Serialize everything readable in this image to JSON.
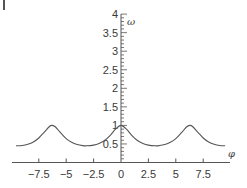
{
  "chart_data": {
    "type": "line",
    "title": "",
    "xlabel": "φ",
    "ylabel": "ω",
    "xlim": [
      -9.6,
      9.5
    ],
    "ylim": [
      0,
      4
    ],
    "grid": false,
    "legend": null,
    "x_ticks": [
      -7.5,
      -5,
      -2.5,
      0,
      2.5,
      5,
      7.5
    ],
    "x_tick_labels": [
      "−7.5",
      "−5",
      "−2.5",
      "0",
      "2.5",
      "5",
      "7.5"
    ],
    "y_ticks": [
      0.5,
      1,
      1.5,
      2,
      2.5,
      3,
      3.5,
      4
    ],
    "y_tick_labels": [
      "0.5",
      "1",
      "1.5",
      "2",
      "2.5",
      "3",
      "3.5",
      "4"
    ],
    "y_minor_tick_step": 0.1,
    "series": [
      {
        "name": "ω(φ)",
        "color": "#555555",
        "x": [
          -9.58,
          -9.0,
          -8.5,
          -8.0,
          -7.5,
          -7.0,
          -6.5,
          -6.2832,
          -6.0,
          -5.5,
          -5.0,
          -4.5,
          -4.0,
          -3.5,
          -3.1416,
          -2.5,
          -2.0,
          -1.5,
          -1.0,
          -0.5,
          0,
          0.5,
          1.0,
          1.5,
          2.0,
          2.5,
          3.1416,
          3.5,
          4.0,
          4.5,
          5.0,
          5.5,
          6.0,
          6.2832,
          6.5,
          7.0,
          7.5,
          8.0,
          8.5,
          9.0,
          9.5
        ],
        "y": [
          0.452,
          0.458,
          0.491,
          0.554,
          0.661,
          0.821,
          0.978,
          1.0,
          0.963,
          0.797,
          0.644,
          0.544,
          0.485,
          0.456,
          0.45,
          0.469,
          0.514,
          0.594,
          0.724,
          0.898,
          1.0,
          0.898,
          0.724,
          0.594,
          0.514,
          0.469,
          0.45,
          0.456,
          0.485,
          0.544,
          0.644,
          0.797,
          0.963,
          1.0,
          0.978,
          0.821,
          0.661,
          0.554,
          0.491,
          0.458,
          0.45
        ]
      }
    ],
    "annotations": []
  },
  "layout": {
    "origin_px": [
      121,
      162.5
    ],
    "x_px_per_unit": 10.96,
    "y_px_per_unit": 37.1,
    "x_axis_px_range": [
      12,
      230
    ],
    "y_axis_top_px": 14
  },
  "colors": {
    "axis": "#555555",
    "curve": "#555555",
    "text": "#3a3a3a"
  }
}
